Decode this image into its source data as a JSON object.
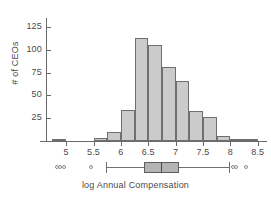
{
  "chart_data": {
    "type": "bar",
    "title": "",
    "subtitle": "",
    "xlabel": "log Annual Compensation",
    "ylabel": "# of CEOs",
    "xlim": [
      4.65,
      8.65
    ],
    "ylim": [
      0,
      135
    ],
    "grid": false,
    "legend": null,
    "x_ticks": [
      "5",
      "5.5",
      "6",
      "6.5",
      "7",
      "7.5",
      "8",
      "8.5"
    ],
    "x_tick_values": [
      5,
      5.5,
      6,
      6.5,
      7,
      7.5,
      8,
      8.5
    ],
    "y_ticks": [
      "25",
      "50",
      "75",
      "100",
      "125"
    ],
    "y_tick_values": [
      25,
      50,
      75,
      100,
      125
    ],
    "bin_width": 0.25,
    "bins": [
      {
        "left": 4.75,
        "right": 5.0,
        "count": 1
      },
      {
        "left": 5.0,
        "right": 5.25,
        "count": 0
      },
      {
        "left": 5.25,
        "right": 5.5,
        "count": 0
      },
      {
        "left": 5.5,
        "right": 5.75,
        "count": 3
      },
      {
        "left": 5.75,
        "right": 6.0,
        "count": 10
      },
      {
        "left": 6.0,
        "right": 6.25,
        "count": 34
      },
      {
        "left": 6.25,
        "right": 6.5,
        "count": 113
      },
      {
        "left": 6.5,
        "right": 6.75,
        "count": 105
      },
      {
        "left": 6.75,
        "right": 7.0,
        "count": 81
      },
      {
        "left": 7.0,
        "right": 7.25,
        "count": 66
      },
      {
        "left": 7.25,
        "right": 7.5,
        "count": 33
      },
      {
        "left": 7.5,
        "right": 7.75,
        "count": 26
      },
      {
        "left": 7.75,
        "right": 8.0,
        "count": 6
      },
      {
        "left": 8.0,
        "right": 8.25,
        "count": 1
      },
      {
        "left": 8.25,
        "right": 8.5,
        "count": 1
      }
    ],
    "categories": [
      "4.75-5.0",
      "5.0-5.25",
      "5.25-5.5",
      "5.5-5.75",
      "5.75-6.0",
      "6.0-6.25",
      "6.25-6.5",
      "6.5-6.75",
      "6.75-7.0",
      "7.0-7.25",
      "7.25-7.5",
      "7.5-7.75",
      "7.75-8.0",
      "8.0-8.25",
      "8.25-8.5"
    ],
    "values": [
      1,
      0,
      0,
      3,
      10,
      34,
      113,
      105,
      81,
      66,
      33,
      26,
      6,
      1,
      1
    ],
    "boxplot": {
      "whisker_low": 5.72,
      "q1": 6.42,
      "median": 6.74,
      "q3": 7.06,
      "whisker_high": 7.98,
      "outliers_low": [
        4.83,
        4.88,
        4.96,
        5.46
      ],
      "outliers_high": [
        8.05,
        8.11,
        8.28
      ]
    }
  }
}
